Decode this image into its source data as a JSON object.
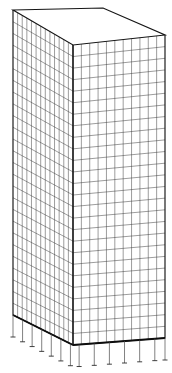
{
  "figure": {
    "type": "wireframe-mesh-diagram",
    "projection": "oblique-axonometric",
    "background_color": "#ffffff",
    "line_color": "#3a3a3a",
    "outline_color": "#151515",
    "support_color": "#2a2a2a"
  },
  "geometry": {
    "vertices": {
      "top_back_left": {
        "x": 13,
        "y": 10
      },
      "top_back_right": {
        "x": 103,
        "y": 8
      },
      "top_front_right": {
        "x": 165,
        "y": 35
      },
      "top_front_left": {
        "x": 73,
        "y": 45
      },
      "bottom_back_left": {
        "x": 13,
        "y": 315
      },
      "bottom_front_left": {
        "x": 73,
        "y": 345
      },
      "bottom_front_right": {
        "x": 165,
        "y": 338
      }
    },
    "left_face": {
      "name": "side-wall-mesh",
      "columns": 13,
      "rows": 26
    },
    "right_face": {
      "name": "front-wall-mesh",
      "columns": 11,
      "rows": 26
    },
    "top_face": {
      "name": "roof-slab",
      "columns": 11,
      "rows": 13,
      "grid_visible": false
    }
  },
  "supports": {
    "label": "fixed-base-supports",
    "left_face_count": 7,
    "right_face_count": 7,
    "stem_length": 22,
    "tick_width": 5
  },
  "annotations": {
    "caption": "",
    "axis_labels": [],
    "legend": []
  }
}
